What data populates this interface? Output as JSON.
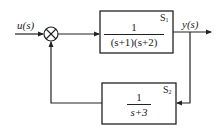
{
  "diagram": {
    "type": "feedback-control-block-diagram",
    "input": {
      "label": "u(s)"
    },
    "output": {
      "label": "y(s)"
    },
    "summing_junction": {
      "symbol": "⊗"
    },
    "blocks": [
      {
        "id": "S1",
        "name": "S",
        "subscript": "1",
        "numerator": "1",
        "denominator": "(s+1)(s+2)",
        "position": "forward"
      },
      {
        "id": "S2",
        "name": "S",
        "subscript": "2",
        "numerator": "1",
        "denominator": "s+3",
        "position": "feedback"
      }
    ]
  },
  "colors": {
    "line": "#222222",
    "background": "#ffffff"
  }
}
